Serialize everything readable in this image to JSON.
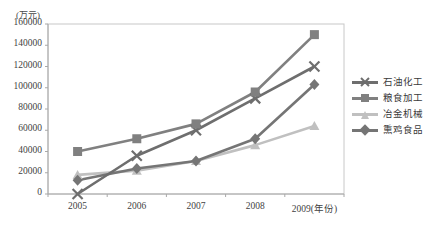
{
  "chart_data": {
    "type": "line",
    "title": "",
    "xlabel": "年份",
    "ylabel": "万元",
    "y_axis_unit_label": "(万元)",
    "categories": [
      "2005",
      "2006",
      "2007",
      "2008",
      "2009(年份)"
    ],
    "x_values": [
      2005,
      2006,
      2007,
      2008,
      2009
    ],
    "ylim": [
      0,
      160000
    ],
    "yticks": [
      "0",
      "20000",
      "40000",
      "60000",
      "80000",
      "100000",
      "120000",
      "140000",
      "160000"
    ],
    "ytick_values": [
      0,
      20000,
      40000,
      60000,
      80000,
      100000,
      120000,
      140000,
      160000
    ],
    "grid": false,
    "legend_position": "right",
    "series": [
      {
        "name": "石油化工",
        "marker": "x",
        "color": "#6e6e6e",
        "values": [
          0,
          36000,
          60000,
          90000,
          120000
        ]
      },
      {
        "name": "粮食加工",
        "marker": "square",
        "color": "#808080",
        "values": [
          40000,
          52000,
          66000,
          96000,
          150000
        ]
      },
      {
        "name": "冶金机械",
        "marker": "triangle",
        "color": "#c0c0c0",
        "values": [
          18000,
          22000,
          31000,
          46000,
          64000
        ]
      },
      {
        "name": "熏鸡食品",
        "marker": "diamond",
        "color": "#757575",
        "values": [
          13000,
          24000,
          31000,
          52000,
          103000
        ]
      }
    ]
  },
  "colors": {
    "plot_border": "#c8c8c8",
    "axis": "#a8a8a8",
    "text": "#3a3a3a",
    "background": "#ffffff"
  }
}
